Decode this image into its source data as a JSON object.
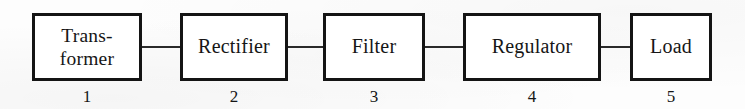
{
  "diagram": {
    "background_color": "#fdfdfd",
    "line_color": "#141414",
    "text_color": "#161616",
    "blocks": [
      {
        "label": "Trans-\nformer",
        "index": "1",
        "x": 32,
        "y": 13,
        "width": 110,
        "height": 68,
        "two_line": true
      },
      {
        "label": "Rectifier",
        "index": "2",
        "x": 180,
        "y": 13,
        "width": 108,
        "height": 68,
        "two_line": false
      },
      {
        "label": "Filter",
        "index": "3",
        "x": 323,
        "y": 13,
        "width": 102,
        "height": 68,
        "two_line": false
      },
      {
        "label": "Regulator",
        "index": "4",
        "x": 463,
        "y": 13,
        "width": 138,
        "height": 68,
        "two_line": false
      },
      {
        "label": "Load",
        "index": "5",
        "x": 630,
        "y": 13,
        "width": 82,
        "height": 68,
        "two_line": false
      }
    ],
    "connectors": [
      {
        "from": "Transformer",
        "to": "Rectifier",
        "x": 142,
        "y": 46,
        "length": 38
      },
      {
        "from": "Rectifier",
        "to": "Filter",
        "x": 288,
        "y": 46,
        "length": 35
      },
      {
        "from": "Filter",
        "to": "Regulator",
        "x": 425,
        "y": 46,
        "length": 38
      },
      {
        "from": "Regulator",
        "to": "Load",
        "x": 601,
        "y": 46,
        "length": 29
      }
    ],
    "index_row_y": 88
  }
}
